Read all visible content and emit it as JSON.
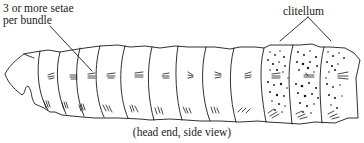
{
  "labels": {
    "setae_line1": "3 or more setae",
    "setae_line2": "per bundle",
    "clitellum": "clitellum",
    "caption": "(head end, side view)"
  },
  "diagram": {
    "stroke_color": "#1a1a1a",
    "background": "#ffffff",
    "segment_count": 13,
    "clitellum_segments": 3
  }
}
